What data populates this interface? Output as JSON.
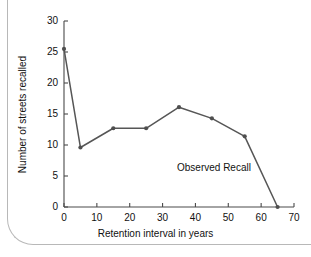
{
  "chart_data": {
    "type": "line",
    "title": "",
    "xlabel": "Retention interval in years",
    "ylabel": "Number of streets recalled",
    "xlim": [
      0,
      70
    ],
    "ylim": [
      0,
      30
    ],
    "xticks": [
      0,
      10,
      20,
      30,
      40,
      50,
      60,
      70
    ],
    "yticks": [
      0,
      5,
      10,
      15,
      20,
      25,
      30
    ],
    "grid": false,
    "legend": "none",
    "annotations": [
      {
        "text": "Observed Recall",
        "x": 42,
        "y": 5
      }
    ],
    "series": [
      {
        "name": "Observed Recall",
        "color": "#565656",
        "marker": "circle",
        "x": [
          0,
          5,
          15,
          25,
          35,
          45,
          55,
          65
        ],
        "values": [
          25.5,
          9.6,
          12.7,
          12.7,
          16.1,
          14.3,
          11.4,
          0
        ]
      }
    ]
  }
}
